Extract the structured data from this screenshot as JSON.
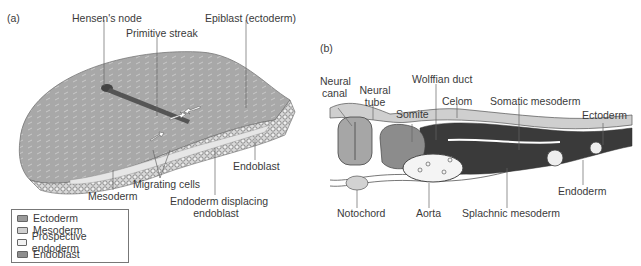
{
  "panel_a": {
    "tag": "(a)",
    "labels": {
      "hensens_node": "Hensen's node",
      "primitive_streak": "Primitive streak",
      "epiblast": "Epiblast (ectoderm)",
      "endoblast": "Endoblast",
      "mesoderm": "Mesoderm",
      "migrating_cells": "Migrating cells",
      "endoderm_displacing_1": "Endoderm displacing",
      "endoderm_displacing_2": "endoblast"
    },
    "legend": [
      {
        "label": "Ectoderm",
        "color": "#9a9a9a"
      },
      {
        "label": "Mesoderm",
        "color": "#cfcfcf"
      },
      {
        "label": "Prospective endoderm",
        "color": "#f2f2f2"
      },
      {
        "label": "Endoblast",
        "color": "#8e8e8e"
      }
    ]
  },
  "panel_b": {
    "tag": "(b)",
    "labels": {
      "neural_canal_1": "Neural",
      "neural_canal_2": "canal",
      "neural_tube_1": "Neural",
      "neural_tube_2": "tube",
      "wolffian_duct": "Wolffian duct",
      "somite": "Somite",
      "celom": "Celom",
      "somatic_mesoderm": "Somatic mesoderm",
      "ectoderm": "Ectoderm",
      "endoderm": "Endoderm",
      "notochord": "Notochord",
      "aorta": "Aorta",
      "splachnic_mesoderm": "Splachnic mesoderm"
    }
  }
}
